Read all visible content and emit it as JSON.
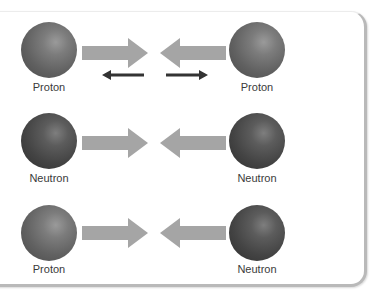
{
  "colors": {
    "big_arrow": "#a5a5a5",
    "small_arrow": "#333333",
    "proton": "#6e6e6e",
    "neutron": "#4a4a4a",
    "card_border": "#b9b9b9"
  },
  "rows": [
    {
      "left": {
        "type": "proton",
        "label": "Proton"
      },
      "right": {
        "type": "proton",
        "label": "Proton"
      },
      "interaction": "attraction-and-repulsion",
      "small_arrows": [
        "arrow-left",
        "arrow-right"
      ]
    },
    {
      "left": {
        "type": "neutron",
        "label": "Neutron"
      },
      "right": {
        "type": "neutron",
        "label": "Neutron"
      },
      "interaction": "attraction"
    },
    {
      "left": {
        "type": "proton",
        "label": "Proton"
      },
      "right": {
        "type": "neutron",
        "label": "Neutron"
      },
      "interaction": "attraction"
    }
  ]
}
